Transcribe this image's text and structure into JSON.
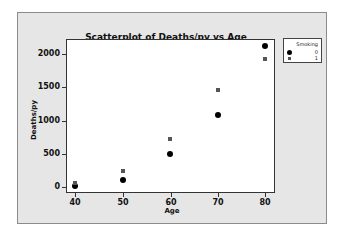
{
  "chart_data": {
    "type": "scatter",
    "title": "Scatterplot of Deaths/py vs Age",
    "xlabel": "Age",
    "ylabel": "Deaths/py",
    "xlim": [
      38,
      83
    ],
    "ylim": [
      -100,
      2300
    ],
    "x_ticks": [
      40,
      50,
      60,
      70,
      80
    ],
    "y_ticks": [
      0,
      500,
      1000,
      1500,
      2000
    ],
    "grid": false,
    "legend_position": "right",
    "legend_title": "Smoking",
    "series": [
      {
        "name": "0",
        "marker": "circle",
        "x": [
          40,
          50,
          60,
          70,
          80
        ],
        "y": [
          18,
          105,
          495,
          1080,
          2120
        ]
      },
      {
        "name": "1",
        "marker": "square",
        "x": [
          40,
          50,
          60,
          70,
          80
        ],
        "y": [
          60,
          240,
          720,
          1460,
          1930
        ]
      }
    ]
  },
  "labels": {
    "title": "Scatterplot of Deaths/py vs Age",
    "xaxis": "Age",
    "yaxis": "Deaths/py",
    "legend_title": "Smoking",
    "legend_0": "0",
    "legend_1": "1",
    "xticks": [
      "40",
      "50",
      "60",
      "70",
      "80"
    ],
    "yticks": [
      "0",
      "500",
      "1000",
      "1500",
      "2000"
    ]
  }
}
